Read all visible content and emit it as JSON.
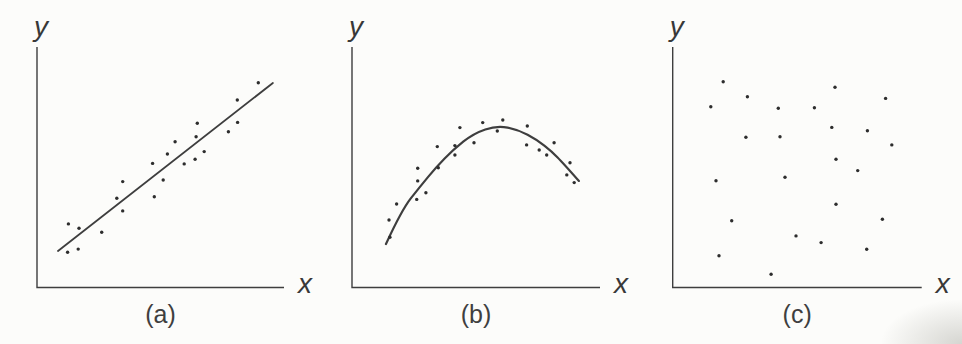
{
  "figure": {
    "background": "#fcfcfa",
    "ink_color": "#3e3e3e",
    "dot_color": "#2d2d2d",
    "text_color": "#383838"
  },
  "chart_data": [
    {
      "panel": "a",
      "type": "scatter",
      "caption": "(a)",
      "xlabel": "x",
      "ylabel": "y",
      "relationship": "positive linear trend with fitted straight line",
      "axis_ticks": "none",
      "x_range": [
        0,
        10
      ],
      "y_range": [
        0,
        10
      ],
      "points": [
        [
          1.27,
          2.63
        ],
        [
          1.7,
          2.45
        ],
        [
          1.24,
          1.45
        ],
        [
          1.67,
          1.58
        ],
        [
          2.62,
          2.28
        ],
        [
          3.23,
          3.7
        ],
        [
          3.47,
          4.39
        ],
        [
          3.47,
          3.17
        ],
        [
          4.68,
          5.15
        ],
        [
          4.75,
          3.76
        ],
        [
          5.11,
          4.46
        ],
        [
          5.28,
          5.54
        ],
        [
          5.59,
          6.05
        ],
        [
          5.96,
          5.13
        ],
        [
          6.4,
          5.32
        ],
        [
          6.44,
          6.26
        ],
        [
          6.49,
          6.82
        ],
        [
          6.77,
          5.64
        ],
        [
          7.75,
          6.47
        ],
        [
          8.11,
          7.79
        ],
        [
          8.12,
          6.86
        ],
        [
          8.96,
          8.51
        ]
      ],
      "fit": {
        "kind": "line",
        "points": [
          [
            0.85,
            1.5
          ],
          [
            9.55,
            8.5
          ]
        ]
      }
    },
    {
      "panel": "b",
      "type": "scatter",
      "caption": "(b)",
      "xlabel": "x",
      "ylabel": "y",
      "relationship": "curvilinear (rises then falls) with fitted smooth curve",
      "axis_ticks": "none",
      "x_range": [
        0,
        10
      ],
      "y_range": [
        0,
        10
      ],
      "points": [
        [
          1.53,
          2.07
        ],
        [
          1.49,
          2.79
        ],
        [
          1.8,
          3.46
        ],
        [
          2.61,
          3.65
        ],
        [
          2.98,
          3.93
        ],
        [
          2.65,
          4.42
        ],
        [
          2.65,
          4.95
        ],
        [
          3.48,
          4.97
        ],
        [
          3.44,
          5.85
        ],
        [
          4.15,
          5.5
        ],
        [
          4.15,
          5.89
        ],
        [
          4.35,
          6.64
        ],
        [
          4.92,
          6.01
        ],
        [
          5.27,
          6.85
        ],
        [
          5.86,
          6.5
        ],
        [
          6.08,
          6.96
        ],
        [
          7.07,
          6.71
        ],
        [
          7.04,
          5.92
        ],
        [
          7.55,
          5.71
        ],
        [
          7.85,
          5.5
        ],
        [
          8.15,
          6.01
        ],
        [
          8.79,
          5.18
        ],
        [
          8.66,
          4.67
        ],
        [
          8.96,
          4.35
        ]
      ],
      "fit": {
        "kind": "curve",
        "points": [
          [
            1.37,
            1.79
          ],
          [
            2.0,
            3.2
          ],
          [
            2.74,
            4.18
          ],
          [
            3.4,
            5.0
          ],
          [
            4.07,
            5.71
          ],
          [
            4.9,
            6.4
          ],
          [
            5.85,
            6.73
          ],
          [
            6.7,
            6.55
          ],
          [
            7.46,
            6.13
          ],
          [
            8.05,
            5.65
          ],
          [
            8.51,
            5.17
          ],
          [
            9.15,
            4.42
          ]
        ]
      }
    },
    {
      "panel": "c",
      "type": "scatter",
      "caption": "(c)",
      "xlabel": "x",
      "ylabel": "y",
      "relationship": "no relationship (random scatter, no fitted line)",
      "axis_ticks": "none",
      "x_range": [
        0,
        10
      ],
      "y_range": [
        0,
        10
      ],
      "points": [
        [
          2.03,
          8.55
        ],
        [
          3.0,
          7.93
        ],
        [
          1.53,
          7.51
        ],
        [
          4.24,
          7.45
        ],
        [
          5.69,
          7.47
        ],
        [
          6.52,
          8.32
        ],
        [
          8.55,
          7.86
        ],
        [
          6.39,
          6.65
        ],
        [
          7.82,
          6.51
        ],
        [
          2.94,
          6.24
        ],
        [
          4.31,
          6.26
        ],
        [
          8.8,
          5.92
        ],
        [
          6.56,
          5.32
        ],
        [
          7.43,
          4.85
        ],
        [
          4.51,
          4.57
        ],
        [
          1.74,
          4.43
        ],
        [
          6.56,
          3.45
        ],
        [
          8.42,
          2.82
        ],
        [
          2.37,
          2.76
        ],
        [
          4.95,
          2.13
        ],
        [
          5.96,
          1.85
        ],
        [
          7.79,
          1.57
        ],
        [
          1.86,
          1.3
        ],
        [
          3.95,
          0.53
        ]
      ],
      "fit": null
    }
  ]
}
